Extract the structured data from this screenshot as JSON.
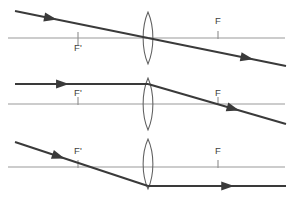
{
  "figure": {
    "width": 293,
    "height": 201,
    "background_color": "#ffffff",
    "axis_color": "#9a9a9a",
    "lens_color": "#5f5f5f",
    "ray_color": "#3a3a3a",
    "label_color": "#404040"
  },
  "labels": {
    "focal_left": "F'",
    "focal_right": "F"
  },
  "panels": [
    {
      "id": "panel-1",
      "rule": "ray-through-optical-center-passes-undeviated",
      "axis": {
        "x1": 8,
        "x2": 285,
        "y": 38
      },
      "lens": {
        "cx": 148,
        "cy": 38,
        "rx": 6.5,
        "ry": 26
      },
      "focal_left": {
        "x": 78,
        "y": 38,
        "label": "F'",
        "label_x": 78,
        "label_y": 51,
        "label_side": "below"
      },
      "focal_right": {
        "x": 218,
        "y": 38,
        "label": "F",
        "label_x": 218,
        "label_y": 24,
        "label_side": "above"
      },
      "rays": [
        {
          "name": "incident-ray",
          "x1": 15,
          "y1": 11,
          "x2": 148,
          "y2": 38,
          "arrow_at": 0.27
        },
        {
          "name": "refracted-ray",
          "x1": 148,
          "y1": 38,
          "x2": 286,
          "y2": 66,
          "arrow_at": 0.72
        }
      ]
    },
    {
      "id": "panel-2",
      "rule": "ray-parallel-to-axis-refracts-through-focal-point-F",
      "axis": {
        "x1": 8,
        "x2": 285,
        "y": 104
      },
      "lens": {
        "cx": 148,
        "cy": 104,
        "rx": 6.5,
        "ry": 26
      },
      "focal_left": {
        "x": 78,
        "y": 104,
        "label": "F'",
        "label_x": 78,
        "label_y": 96,
        "label_side": "above"
      },
      "focal_right": {
        "x": 218,
        "y": 104,
        "label": "F",
        "label_x": 218,
        "label_y": 96,
        "label_side": "above"
      },
      "rays": [
        {
          "name": "incident-ray",
          "x1": 15,
          "y1": 84,
          "x2": 148,
          "y2": 84,
          "arrow_at": 0.36
        },
        {
          "name": "refracted-ray",
          "x1": 148,
          "y1": 84,
          "x2": 286,
          "y2": 124,
          "arrow_at": 0.62
        }
      ]
    },
    {
      "id": "panel-3",
      "rule": "ray-through-focal-point-F-prime-refracts-parallel-to-axis",
      "axis": {
        "x1": 8,
        "x2": 285,
        "y": 167
      },
      "lens": {
        "cx": 148,
        "cy": 164,
        "rx": 6.5,
        "ry": 25
      },
      "focal_left": {
        "x": 78,
        "y": 167,
        "label": "F'",
        "label_x": 78,
        "label_y": 154,
        "label_side": "above"
      },
      "focal_right": {
        "x": 218,
        "y": 167,
        "label": "F",
        "label_x": 218,
        "label_y": 154,
        "label_side": "above"
      },
      "rays": [
        {
          "name": "incident-ray",
          "x1": 15,
          "y1": 142,
          "x2": 148,
          "y2": 186,
          "arrow_at": 0.33
        },
        {
          "name": "refracted-ray",
          "x1": 148,
          "y1": 186,
          "x2": 286,
          "y2": 186,
          "arrow_at": 0.58
        }
      ]
    }
  ]
}
